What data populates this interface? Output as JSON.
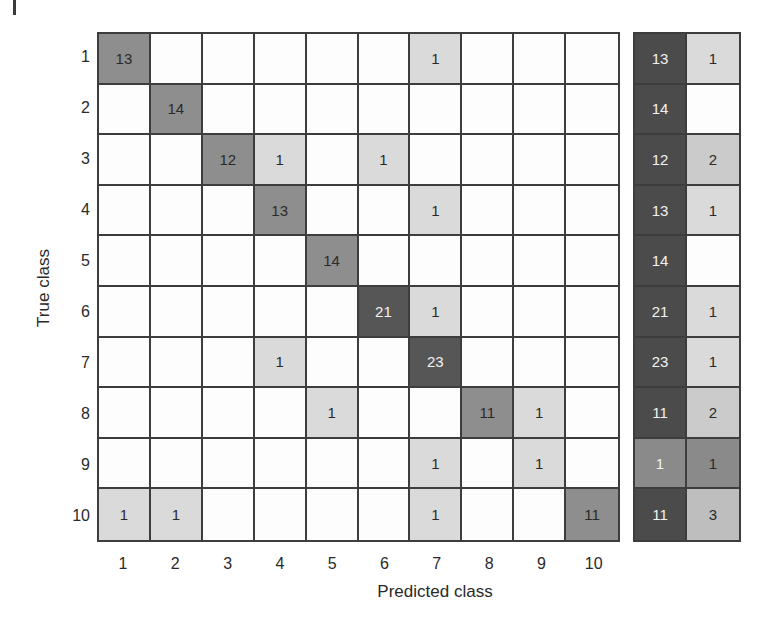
{
  "chart_data": {
    "type": "heatmap",
    "title": "",
    "xlabel": "Predicted class",
    "ylabel": "True class",
    "x_ticks": [
      "1",
      "2",
      "3",
      "4",
      "5",
      "6",
      "7",
      "8",
      "9",
      "10"
    ],
    "y_ticks": [
      "1",
      "2",
      "3",
      "4",
      "5",
      "6",
      "7",
      "8",
      "9",
      "10"
    ],
    "matrix": [
      [
        13,
        0,
        0,
        0,
        0,
        0,
        1,
        0,
        0,
        0
      ],
      [
        0,
        14,
        0,
        0,
        0,
        0,
        0,
        0,
        0,
        0
      ],
      [
        0,
        0,
        12,
        1,
        0,
        1,
        0,
        0,
        0,
        0
      ],
      [
        0,
        0,
        0,
        13,
        0,
        0,
        1,
        0,
        0,
        0
      ],
      [
        0,
        0,
        0,
        0,
        14,
        0,
        0,
        0,
        0,
        0
      ],
      [
        0,
        0,
        0,
        0,
        0,
        21,
        1,
        0,
        0,
        0
      ],
      [
        0,
        0,
        0,
        1,
        0,
        0,
        23,
        0,
        0,
        0
      ],
      [
        0,
        0,
        0,
        0,
        1,
        0,
        0,
        11,
        1,
        0
      ],
      [
        0,
        0,
        0,
        0,
        0,
        0,
        1,
        0,
        1,
        0
      ],
      [
        1,
        1,
        0,
        0,
        0,
        0,
        1,
        0,
        0,
        11
      ]
    ],
    "summary_columns": [
      "correct",
      "incorrect"
    ],
    "summary": [
      [
        13,
        1
      ],
      [
        14,
        0
      ],
      [
        12,
        2
      ],
      [
        13,
        1
      ],
      [
        14,
        0
      ],
      [
        21,
        1
      ],
      [
        23,
        1
      ],
      [
        11,
        2
      ],
      [
        1,
        1
      ],
      [
        11,
        3
      ]
    ],
    "grid": true,
    "legend": null
  },
  "colors": {
    "empty": "#fdfdfd",
    "count_1": "#dadada",
    "count_2": "#cbcbcb",
    "count_3": "#bebebe",
    "mid": "#8e8e8e",
    "dark": "#565656",
    "summary_dark": "#4b4b4b",
    "summary_mid": "#8a8a8a",
    "text_dark": "#2a2a2a",
    "text_light": "#f2f2f2"
  }
}
